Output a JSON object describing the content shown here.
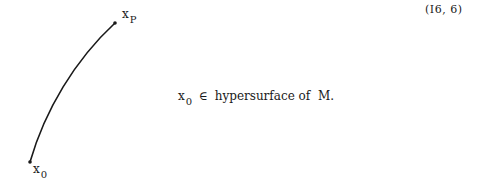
{
  "equation_number": "(I6, 6)",
  "figure": {
    "curve": {
      "start": [
        30,
        162
      ],
      "end": [
        115,
        23
      ]
    },
    "endpoint_top": {
      "symbol": "x",
      "subscript": "P"
    },
    "endpoint_bottom": {
      "symbol": "x",
      "subscript": "0"
    }
  },
  "statement": {
    "symbol": "x",
    "subscript": "0",
    "relation": "∈",
    "text": "hypersurface of  M."
  }
}
